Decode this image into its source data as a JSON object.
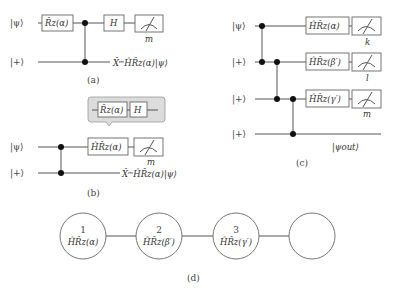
{
  "panel_a": {
    "caption": "(a)",
    "inputs": [
      "|ψ⟩",
      "|+⟩"
    ],
    "gates": {
      "rz": "R̂z(α)",
      "h": "H"
    },
    "measure_label": "m",
    "output": "X̂ᵐĤR̂z(α)|ψ⟩"
  },
  "panel_b": {
    "caption": "(b)",
    "inputs": [
      "|ψ⟩",
      "|+⟩"
    ],
    "callout": {
      "rz": "R̂z(α)",
      "h": "H"
    },
    "gate": "ĤR̂z(α)",
    "measure_label": "m",
    "output": "X̂ᵐĤR̂z(α)|ψ⟩"
  },
  "panel_c": {
    "caption": "(c)",
    "inputs": [
      "|ψ⟩",
      "|+⟩",
      "|+⟩",
      "|+⟩"
    ],
    "gates": [
      "ĤR̂z(α)",
      "ĤR̂z(β′)",
      "ĤR̂z(γ′)"
    ],
    "measure_labels": [
      "k",
      "l",
      "m"
    ],
    "output": "|ψout⟩"
  },
  "panel_d": {
    "caption": "(d)",
    "nodes": [
      {
        "index": "1",
        "gate": "ĤR̂z(α)"
      },
      {
        "index": "2",
        "gate": "ĤR̂z(β′)"
      },
      {
        "index": "3",
        "gate": "ĤR̂z(γ′)"
      },
      {
        "index": "",
        "gate": ""
      }
    ]
  }
}
